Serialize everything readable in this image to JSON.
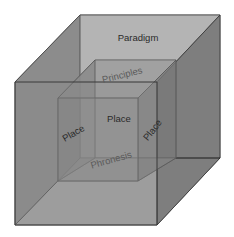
{
  "diagram": {
    "type": "nested-cube",
    "outer_cube": {
      "label_back_face": "Paradigm"
    },
    "inner_cube": {
      "label_top_face": "Principles",
      "label_front_face": "Place",
      "label_left_face": "Place",
      "label_right_face": "Place",
      "label_bottom_face": "Phronesis"
    },
    "colors": {
      "background": "#ffffff",
      "outer_back_face": "#c2c2c2",
      "outer_top_face": "#b2b2b2",
      "outer_left_face": "#8a8a8a",
      "outer_right_face": "#7d7d7d",
      "outer_bottom_face": "#a6a6a6",
      "outer_front_face": "#8f8f8f",
      "edge": "#3a3a3a"
    }
  }
}
